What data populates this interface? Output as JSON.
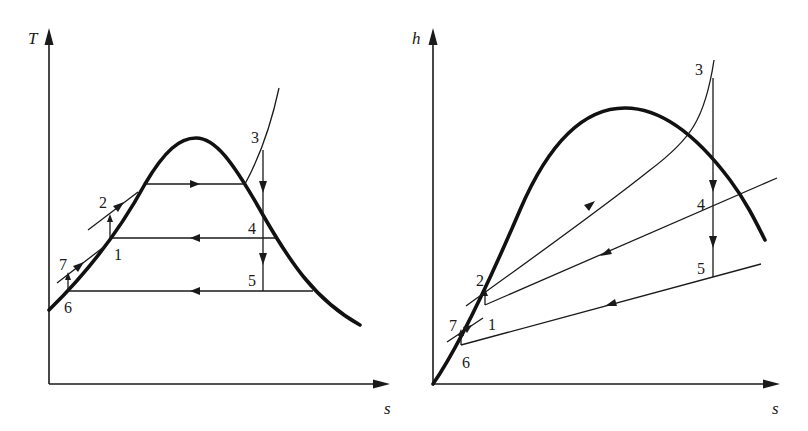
{
  "figure": {
    "colors": {
      "ink": "#1a1a1a",
      "background": "#ffffff"
    },
    "diagrams": [
      {
        "id": "T-s",
        "y_axis_label": "T",
        "x_axis_label": "s",
        "state_points": [
          "1",
          "2",
          "3",
          "4",
          "5",
          "6",
          "7"
        ]
      },
      {
        "id": "h-s",
        "y_axis_label": "h",
        "x_axis_label": "s",
        "state_points": [
          "1",
          "2",
          "3",
          "4",
          "5",
          "6",
          "7"
        ]
      }
    ]
  }
}
